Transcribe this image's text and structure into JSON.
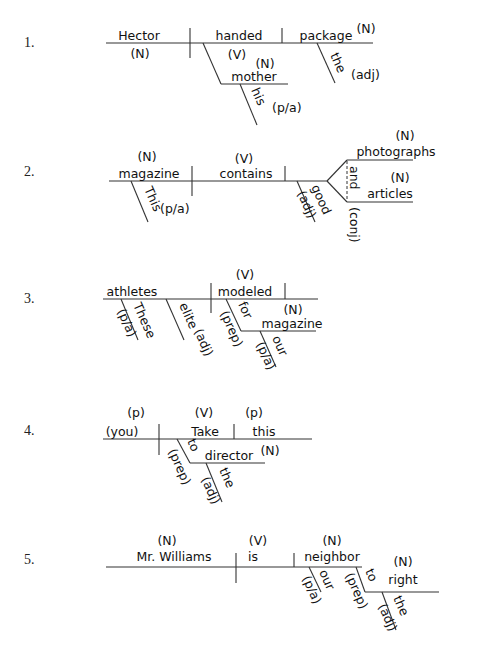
{
  "worksheet": {
    "diagrams": [
      {
        "number": "1.",
        "subject": "Hector",
        "subject_tag": "(N)",
        "verb": "handed",
        "verb_tag": "(V)",
        "direct_object": "package",
        "direct_object_tag": "(N)",
        "indirect_object": "mother",
        "indirect_object_tag": "(N)",
        "modifier_io": "his",
        "modifier_io_tag": "(p/a)",
        "modifier_do": "the",
        "modifier_do_tag": "(adj)"
      },
      {
        "number": "2.",
        "subject": "magazine",
        "subject_tag": "(N)",
        "verb": "contains",
        "verb_tag": "(V)",
        "object_1": "photographs",
        "object_1_tag": "(N)",
        "object_2": "articles",
        "object_2_tag": "(N)",
        "conjunction": "and",
        "conjunction_tag": "(conj)",
        "modifier_subject": "This",
        "modifier_subject_tag": "(p/a)",
        "modifier_object": "good",
        "modifier_object_tag": "(adj)"
      },
      {
        "number": "3.",
        "subject": "athletes",
        "verb": "modeled",
        "verb_tag": "(V)",
        "modifier_1": "These",
        "modifier_1_tag": "(p/a)",
        "modifier_2": "elite",
        "modifier_2_tag": "(adj)",
        "preposition": "for",
        "preposition_tag": "(prep)",
        "prep_object": "magazine",
        "prep_object_tag": "(N)",
        "prep_object_modifier": "our",
        "prep_object_modifier_tag": "(p/a)"
      },
      {
        "number": "4.",
        "subject": "(you)",
        "subject_tag": "(p)",
        "verb": "Take",
        "verb_tag": "(V)",
        "direct_object": "this",
        "direct_object_tag": "(p)",
        "preposition": "to",
        "preposition_tag": "(prep)",
        "prep_object": "director",
        "prep_object_tag": "(N)",
        "prep_object_modifier": "the",
        "prep_object_modifier_tag": "(adj)"
      },
      {
        "number": "5.",
        "subject": "Mr. Williams",
        "subject_tag": "(N)",
        "verb": "is",
        "verb_tag": "(V)",
        "complement": "neighbor",
        "complement_tag": "(N)",
        "complement_modifier": "our",
        "complement_modifier_tag": "(p/a)",
        "preposition": "to",
        "preposition_tag": "(prep)",
        "prep_object": "right",
        "prep_object_tag": "(N)",
        "prep_object_modifier": "the",
        "prep_object_modifier_tag": "(adj)"
      }
    ]
  }
}
